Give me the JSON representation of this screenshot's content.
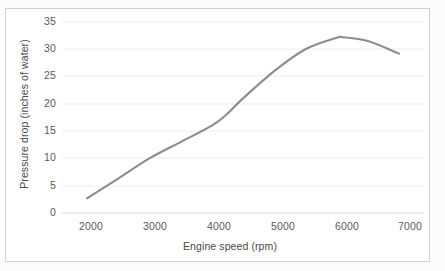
{
  "chart_data": {
    "type": "line",
    "title": "",
    "xlabel": "Engine speed (rpm)",
    "ylabel": "Pressure drop (inches of water)",
    "xlim": [
      1600,
      7400
    ],
    "ylim": [
      0,
      35
    ],
    "xticks": [
      "2000",
      "3000",
      "4000",
      "5000",
      "6000",
      "7000"
    ],
    "yticks": [
      "0",
      "5",
      "10",
      "15",
      "20",
      "25",
      "30",
      "35"
    ],
    "grid": "horizontal",
    "legend": "none",
    "line_color": "#8c8c8c",
    "series": [
      {
        "name": "Pressure drop",
        "x": [
          2000,
          2500,
          3000,
          3500,
          4000,
          4250,
          4500,
          5000,
          5500,
          6000,
          6100,
          6500,
          7000
        ],
        "values": [
          2.7,
          6.3,
          10.0,
          13.0,
          16.0,
          18.2,
          21.0,
          26.0,
          30.0,
          32.1,
          32.2,
          31.5,
          29.2
        ]
      }
    ]
  },
  "axes": {
    "x_title": "Engine speed (rpm)",
    "y_title": "Pressure drop (inches of water)"
  }
}
